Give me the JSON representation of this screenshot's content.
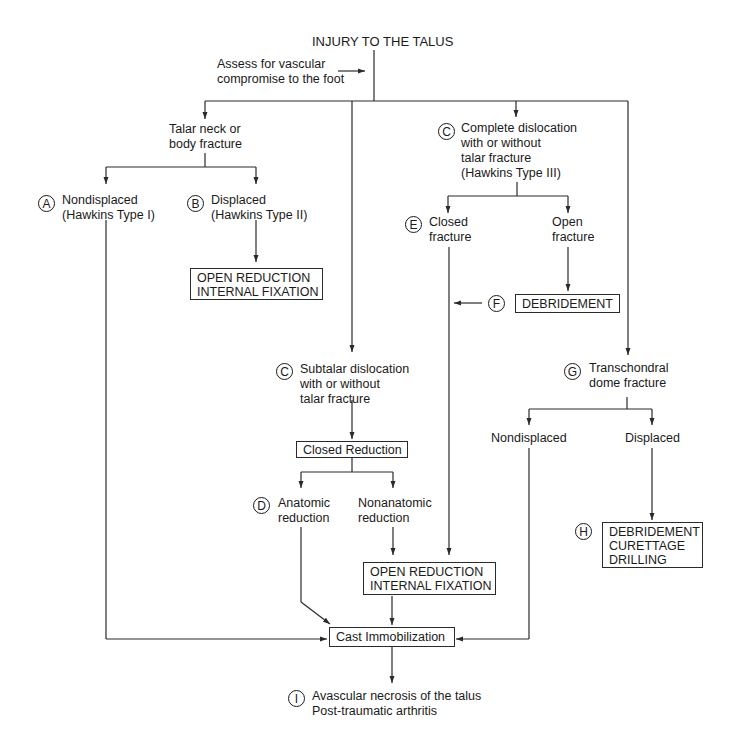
{
  "title": "INJURY TO THE TALUS",
  "assess_note": [
    "Assess for vascular",
    "compromise to the foot"
  ],
  "nodes": {
    "talar_neck": {
      "lines": [
        "Talar neck or",
        "body fracture"
      ]
    },
    "A": {
      "label": "A",
      "lines": [
        "Nondisplaced",
        "(Hawkins Type I)"
      ]
    },
    "B": {
      "label": "B",
      "lines": [
        "Displaced",
        "(Hawkins Type II)"
      ]
    },
    "orif_top": {
      "lines": [
        "OPEN REDUCTION",
        "INTERNAL FIXATION"
      ]
    },
    "C_complete": {
      "label": "C",
      "lines": [
        "Complete dislocation",
        "with or without",
        "talar fracture",
        "(Hawkins Type III)"
      ]
    },
    "E": {
      "label": "E",
      "lines": [
        "Closed",
        "fracture"
      ]
    },
    "open_fracture": {
      "lines": [
        "Open",
        "fracture"
      ]
    },
    "F": {
      "label": "F",
      "box": "DEBRIDEMENT"
    },
    "C_subtalar": {
      "label": "C",
      "lines": [
        "Subtalar dislocation",
        "with or without",
        "talar fracture"
      ]
    },
    "closed_reduction": {
      "box": "Closed Reduction"
    },
    "D": {
      "label": "D",
      "lines": [
        "Anatomic",
        "reduction"
      ]
    },
    "nonanatomic": {
      "lines": [
        "Nonanatomic",
        "reduction"
      ]
    },
    "orif_bottom": {
      "lines": [
        "OPEN REDUCTION",
        "INTERNAL FIXATION"
      ]
    },
    "G": {
      "label": "G",
      "lines": [
        "Transchondral",
        "dome fracture"
      ]
    },
    "nondisplaced_g": {
      "lines": [
        "Nondisplaced"
      ]
    },
    "displaced_g": {
      "lines": [
        "Displaced"
      ]
    },
    "H": {
      "label": "H",
      "lines": [
        "DEBRIDEMENT",
        "CURETTAGE",
        "DRILLING"
      ]
    },
    "cast": {
      "box": "Cast Immobilization"
    },
    "I": {
      "label": "I",
      "lines": [
        "Avascular necrosis of the talus",
        "Post-traumatic arthritis"
      ]
    }
  },
  "colors": {
    "line": "#2a2a2a",
    "text": "#1a1a1a",
    "background": "#ffffff"
  }
}
